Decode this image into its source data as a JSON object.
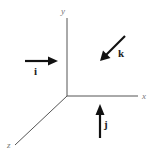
{
  "diagram": {
    "axes": [
      {
        "id": "y",
        "label": "y"
      },
      {
        "id": "x",
        "label": "x"
      },
      {
        "id": "z",
        "label": "z"
      }
    ],
    "vectors": [
      {
        "id": "i",
        "label": "i",
        "direction": "right"
      },
      {
        "id": "k",
        "label": "k",
        "direction": "down-left"
      },
      {
        "id": "j",
        "label": "j",
        "direction": "up"
      }
    ],
    "colors": {
      "axis": "#555555",
      "vector": "#111111",
      "background": "#ffffff"
    }
  }
}
